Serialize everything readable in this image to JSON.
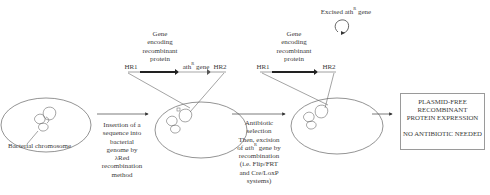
{
  "diagram": {
    "stage1": {
      "label": "Bacterial chromosome"
    },
    "step1": {
      "lines": [
        "Insertion of a",
        "sequence into",
        "bacterial",
        "genome by",
        "λRed",
        "recombination",
        "method"
      ]
    },
    "stage2": {
      "construct": {
        "hr1": "HR1",
        "gene_label_lines": [
          "Gene",
          "encoding",
          "recombinant",
          "protein"
        ],
        "ath_gene_prefix": "ath",
        "ath_gene_sup": "R",
        "ath_gene_suffix": " gene",
        "hr2": "HR2"
      }
    },
    "step2": {
      "line1": "Antibiotic",
      "line2": "selection",
      "line3": "Then, excision",
      "line4_prefix": "of ",
      "line4_italic": "ath",
      "line4_sup": "R",
      "line4_suffix": " gene by",
      "line5": "recombination",
      "line6": "(i.e. Flip/FRT",
      "line7": "and Cre/LoxP",
      "line8": "systems)"
    },
    "stage3": {
      "construct": {
        "hr1": "HR1",
        "gene_label_lines": [
          "Gene",
          "encoding",
          "recombinant",
          "protein"
        ],
        "hr2": "HR2"
      },
      "excised": {
        "prefix": "Excised ath",
        "sup": "R",
        "suffix": " gene"
      }
    },
    "result_box": {
      "lines": [
        "PLASMID-FREE",
        "RECOMBINANT",
        "PROTEIN EXPRESSION"
      ],
      "note": "NO ANTIBIOTIC NEEDED"
    },
    "colors": {
      "line": "#555555",
      "gene_bar": "#222222",
      "ath_bar": "#b5b5b5",
      "box_border": "#9a9a9a"
    }
  }
}
